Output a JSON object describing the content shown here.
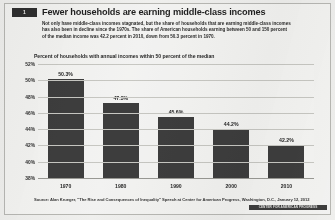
{
  "figure": {
    "badge_label": "1",
    "title": "Fewer households are earning middle-class incomes",
    "deck": "Not only have middle-class incomes stagnated, but the share of households that are earning middle-class incomes has also been in decline since the 1970s. The share of American households earning between 50 and 150 percent of the median income was 42.2 percent in 2010, down from 50.3 percent in 1970.",
    "source": "Source: Alan Krueger, \"The Rise and Consequences of Inequality\" Speech at Center for American Progress, Washington, D.C., January 12, 2012",
    "credit": "CENTER FOR AMERICAN PROGRESS"
  },
  "colors": {
    "bar": "#3b3b3b",
    "badge": "#2c2c2c",
    "grid": "#c9c9c4",
    "page": "#f6f6f4"
  },
  "chart_data": {
    "type": "bar",
    "title": "Percent of households with annual incomes within 50 percent of the median",
    "xlabel": "",
    "ylabel": "",
    "categories": [
      "1970",
      "1980",
      "1990",
      "2000",
      "2010"
    ],
    "values": [
      50.3,
      47.3,
      45.6,
      44.2,
      42.2
    ],
    "value_labels": [
      "50.3%",
      "47.3%",
      "45.6%",
      "44.2%",
      "42.2%"
    ],
    "ylim": [
      38,
      52
    ],
    "yticks": [
      52,
      50,
      48,
      46,
      44,
      42,
      40,
      38
    ],
    "ytick_labels": [
      "52%",
      "50%",
      "48%",
      "46%",
      "44%",
      "42%",
      "40%",
      "38%"
    ],
    "grid": true,
    "legend": "none"
  }
}
